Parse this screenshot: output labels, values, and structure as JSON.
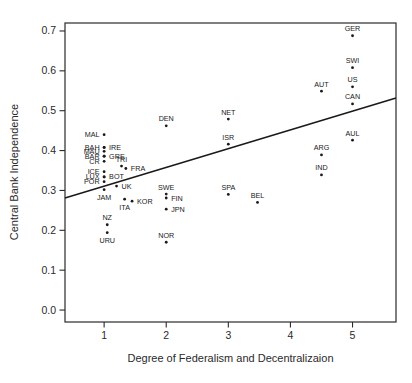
{
  "figure": {
    "background": "#ffffff",
    "frame_color": "#2a2a2a",
    "point_color": "#1a1a1a",
    "line_color": "#1a1a1a",
    "text_color": "#2a2a2a"
  },
  "chart_data": {
    "type": "scatter",
    "title": "",
    "xlabel": "Degree of Federalism and Decentralizaion",
    "ylabel": "Central Bank Independence",
    "xlim": [
      0.37,
      5.7
    ],
    "ylim": [
      -0.03,
      0.72
    ],
    "x_ticks": [
      1,
      2,
      3,
      4,
      5
    ],
    "y_ticks": [
      0.0,
      0.1,
      0.2,
      0.3,
      0.4,
      0.5,
      0.6,
      0.7
    ],
    "grid": false,
    "legend": false,
    "trend_line": {
      "x1": 0.37,
      "y1": 0.281,
      "x2": 5.7,
      "y2": 0.532
    },
    "points": [
      {
        "label": "GER",
        "x": 5.0,
        "y": 0.688,
        "label_pos": "above"
      },
      {
        "label": "SWI",
        "x": 5.0,
        "y": 0.608,
        "label_pos": "above"
      },
      {
        "label": "US",
        "x": 5.0,
        "y": 0.56,
        "label_pos": "above"
      },
      {
        "label": "CAN",
        "x": 5.0,
        "y": 0.517,
        "label_pos": "above"
      },
      {
        "label": "AUT",
        "x": 4.5,
        "y": 0.549,
        "label_pos": "above"
      },
      {
        "label": "AUL",
        "x": 5.0,
        "y": 0.426,
        "label_pos": "above"
      },
      {
        "label": "ARG",
        "x": 4.5,
        "y": 0.389,
        "label_pos": "above"
      },
      {
        "label": "IND",
        "x": 4.5,
        "y": 0.339,
        "label_pos": "above"
      },
      {
        "label": "NET",
        "x": 3.0,
        "y": 0.479,
        "label_pos": "above"
      },
      {
        "label": "ISR",
        "x": 3.0,
        "y": 0.416,
        "label_pos": "above"
      },
      {
        "label": "SPA",
        "x": 3.0,
        "y": 0.29,
        "label_pos": "above"
      },
      {
        "label": "BEL",
        "x": 3.47,
        "y": 0.27,
        "label_pos": "above"
      },
      {
        "label": "DEN",
        "x": 2.0,
        "y": 0.462,
        "label_pos": "above"
      },
      {
        "label": "SWE",
        "x": 2.0,
        "y": 0.291,
        "label_pos": "above"
      },
      {
        "label": "FIN",
        "x": 2.0,
        "y": 0.281,
        "label_pos": "right"
      },
      {
        "label": "JPN",
        "x": 2.0,
        "y": 0.253,
        "label_pos": "right"
      },
      {
        "label": "NOR",
        "x": 2.0,
        "y": 0.17,
        "label_pos": "above"
      },
      {
        "label": "MAL",
        "x": 1.0,
        "y": 0.44,
        "label_pos": "left"
      },
      {
        "label": "BAH",
        "x": 1.0,
        "y": 0.408,
        "label_pos": "left"
      },
      {
        "label": "IRE",
        "x": 1.0,
        "y": 0.408,
        "label_pos": "right"
      },
      {
        "label": "MAU",
        "x": 1.0,
        "y": 0.398,
        "label_pos": "left"
      },
      {
        "label": "BAR",
        "x": 1.0,
        "y": 0.386,
        "label_pos": "left"
      },
      {
        "label": "GRE",
        "x": 1.0,
        "y": 0.386,
        "label_pos": "right"
      },
      {
        "label": "CR",
        "x": 1.0,
        "y": 0.373,
        "label_pos": "left"
      },
      {
        "label": "TRI",
        "x": 1.28,
        "y": 0.361,
        "label_pos": "above"
      },
      {
        "label": "FRA",
        "x": 1.35,
        "y": 0.355,
        "label_pos": "right"
      },
      {
        "label": "ICE",
        "x": 1.0,
        "y": 0.347,
        "label_pos": "left"
      },
      {
        "label": "LUX",
        "x": 1.0,
        "y": 0.334,
        "label_pos": "left"
      },
      {
        "label": "BOT",
        "x": 1.0,
        "y": 0.334,
        "label_pos": "right"
      },
      {
        "label": "POR",
        "x": 1.0,
        "y": 0.322,
        "label_pos": "left"
      },
      {
        "label": "UK",
        "x": 1.2,
        "y": 0.311,
        "label_pos": "right"
      },
      {
        "label": "JAM",
        "x": 1.0,
        "y": 0.302,
        "label_pos": "below"
      },
      {
        "label": "ITA",
        "x": 1.33,
        "y": 0.278,
        "label_pos": "below"
      },
      {
        "label": "KOR",
        "x": 1.45,
        "y": 0.273,
        "label_pos": "right"
      },
      {
        "label": "NZ",
        "x": 1.05,
        "y": 0.214,
        "label_pos": "above"
      },
      {
        "label": "URU",
        "x": 1.05,
        "y": 0.194,
        "label_pos": "below"
      }
    ]
  }
}
